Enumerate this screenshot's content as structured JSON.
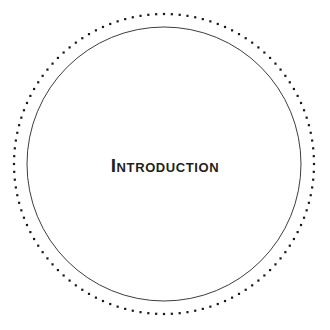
{
  "page": {
    "background_color": "#ffffff",
    "width": 330,
    "height": 330
  },
  "emblem": {
    "center_x": 164,
    "center_y": 164,
    "dotted_ring": {
      "radius": 150,
      "dot_count": 120,
      "dot_size": 2.2,
      "color": "#1a1a1a"
    },
    "solid_ring": {
      "radius": 137,
      "stroke_width": 1,
      "color": "#3d3d3d"
    }
  },
  "title": {
    "text": "Introduction",
    "display_text": "INTRODUCTION",
    "color": "#231f20",
    "center_x": 164,
    "center_y": 168
  }
}
